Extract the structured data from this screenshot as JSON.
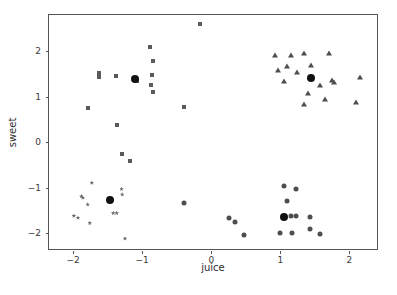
{
  "chart_data": {
    "type": "scatter",
    "title": "",
    "xlabel": "juice",
    "ylabel": "sweet",
    "xlim": [
      -2.35,
      2.4
    ],
    "ylim": [
      -2.35,
      2.8
    ],
    "xticks": [
      -2,
      -1,
      0,
      1,
      2
    ],
    "xtick_labels": [
      "−2",
      "−1",
      "0",
      "1",
      "2"
    ],
    "yticks": [
      -2,
      -1,
      0,
      1,
      2
    ],
    "ytick_labels": [
      "−2",
      "−1",
      "0",
      "1",
      "2"
    ],
    "grid": false,
    "legend": "none",
    "colors": {
      "cluster_square": "#5a5a5a",
      "cluster_triangle": "#4e4e4e",
      "cluster_star": "#6a6a6a",
      "cluster_circle": "#4e4e4e",
      "centroid": "#111111",
      "axis": "#555555",
      "background": "#ffffff"
    },
    "series": [
      {
        "name": "cluster-1",
        "marker": "square",
        "color": "#5a5a5a",
        "points": [
          [
            -1.63,
            1.53
          ],
          [
            -1.63,
            1.44
          ],
          [
            -1.62,
            1.47
          ],
          [
            -1.38,
            1.45
          ],
          [
            -1.1,
            1.42
          ],
          [
            -1.08,
            1.35
          ],
          [
            -0.89,
            2.1
          ],
          [
            -0.84,
            1.79
          ],
          [
            -0.86,
            1.47
          ],
          [
            -0.88,
            1.27
          ],
          [
            -0.85,
            1.11
          ],
          [
            -1.78,
            0.75
          ],
          [
            -1.37,
            0.39
          ],
          [
            -0.4,
            0.78
          ],
          [
            -0.17,
            2.6
          ],
          [
            -1.3,
            -0.26
          ],
          [
            -1.17,
            -0.42
          ]
        ]
      },
      {
        "name": "cluster-2",
        "marker": "triangle",
        "color": "#4e4e4e",
        "points": [
          [
            0.93,
            1.92
          ],
          [
            1.16,
            1.91
          ],
          [
            1.35,
            1.97
          ],
          [
            1.7,
            1.96
          ],
          [
            0.96,
            1.58
          ],
          [
            1.1,
            1.68
          ],
          [
            1.24,
            1.55
          ],
          [
            1.45,
            1.7
          ],
          [
            1.06,
            1.34
          ],
          [
            1.44,
            1.42
          ],
          [
            1.57,
            1.27
          ],
          [
            1.75,
            1.37
          ],
          [
            1.78,
            1.33
          ],
          [
            2.15,
            1.44
          ],
          [
            1.4,
            1.08
          ],
          [
            1.34,
            0.85
          ],
          [
            1.65,
            0.96
          ],
          [
            2.1,
            0.88
          ]
        ]
      },
      {
        "name": "cluster-3",
        "marker": "star",
        "color": "#6a6a6a",
        "points": [
          [
            -1.73,
            -0.89
          ],
          [
            -1.88,
            -1.19
          ],
          [
            -1.86,
            -1.22
          ],
          [
            -1.79,
            -1.37
          ],
          [
            -1.47,
            -1.28
          ],
          [
            -1.3,
            -1.03
          ],
          [
            -1.29,
            -1.15
          ],
          [
            -1.99,
            -1.62
          ],
          [
            -1.93,
            -1.66
          ],
          [
            -1.42,
            -1.56
          ],
          [
            -1.37,
            -1.56
          ],
          [
            -1.76,
            -1.78
          ],
          [
            -1.25,
            -2.12
          ]
        ]
      },
      {
        "name": "cluster-4",
        "marker": "circle",
        "color": "#4e4e4e",
        "points": [
          [
            1.05,
            -0.97
          ],
          [
            1.22,
            -1.04
          ],
          [
            1.1,
            -1.29
          ],
          [
            1.06,
            -1.64
          ],
          [
            1.16,
            -1.62
          ],
          [
            1.22,
            -1.62
          ],
          [
            1.43,
            -1.64
          ],
          [
            0.25,
            -1.66
          ],
          [
            0.34,
            -1.75
          ],
          [
            -0.4,
            -1.33
          ],
          [
            0.48,
            -2.04
          ],
          [
            1.0,
            -1.99
          ],
          [
            1.17,
            -2.0
          ],
          [
            1.43,
            -1.91
          ],
          [
            1.58,
            -2.02
          ]
        ]
      },
      {
        "name": "centroids",
        "marker": "centroid",
        "color": "#111111",
        "points": [
          [
            -1.1,
            1.4
          ],
          [
            1.45,
            1.42
          ],
          [
            -1.47,
            -1.27
          ],
          [
            1.06,
            -1.64
          ]
        ]
      }
    ]
  }
}
